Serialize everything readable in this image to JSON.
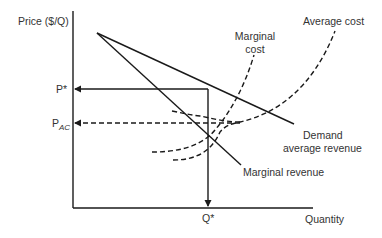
{
  "diagram": {
    "type": "monopoly-pricing",
    "axes": {
      "y_label": "Price ($/Q)",
      "x_label": "Quantity"
    },
    "ticks": {
      "p_star": "P*",
      "p_ac_main": "P",
      "p_ac_sub": "AC",
      "q_star": "Q*"
    },
    "curves": {
      "marginal_cost_line1": "Marginal",
      "marginal_cost_line2": "cost",
      "average_cost": "Average cost",
      "demand_line1": "Demand",
      "demand_line2": "average revenue",
      "marginal_revenue": "Marginal revenue"
    },
    "colors": {
      "line": "#1a1a1a",
      "text": "#333333",
      "background": "#ffffff"
    }
  }
}
